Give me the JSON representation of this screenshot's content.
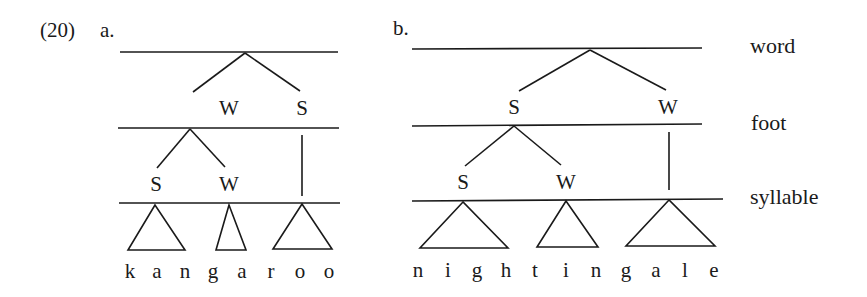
{
  "example_number": "(20)",
  "trees": [
    {
      "label": "a.",
      "word": "kangaroo",
      "letters": [
        "k",
        "a",
        "n",
        "g",
        "a",
        "r",
        "o",
        "o"
      ],
      "word_level": {
        "children": [
          "W",
          "S"
        ]
      },
      "foot_level": {
        "children_of_W": [
          "S",
          "W"
        ],
        "children_of_S": []
      },
      "syllables": 3
    },
    {
      "label": "b.",
      "word": "nightingale",
      "letters": [
        "n",
        "i",
        "g",
        "h",
        "t",
        "i",
        "n",
        "g",
        "a",
        "l",
        "e"
      ],
      "word_level": {
        "children": [
          "S",
          "W"
        ]
      },
      "foot_level": {
        "children_of_S": [
          "S",
          "W"
        ],
        "children_of_W": []
      },
      "syllables": 3
    }
  ],
  "tiers": [
    "word",
    "foot",
    "syllable"
  ],
  "line_color": "#1a1a1a"
}
